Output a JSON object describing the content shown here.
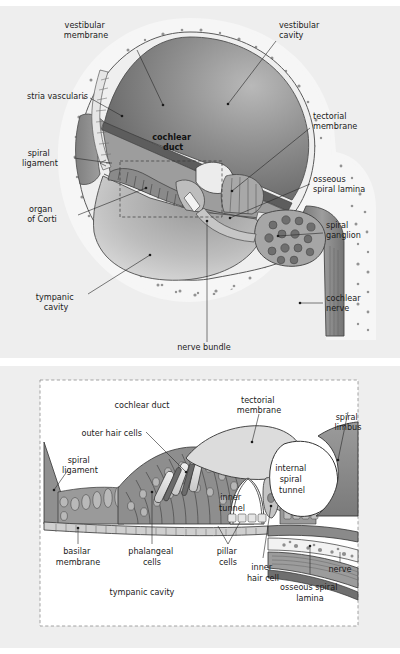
{
  "figure": {
    "background_color": "#ffffff",
    "panel_background_color": "#eeeeee",
    "ink_color": "#1b1b1b"
  },
  "palette": {
    "bone_fill": "#f4f4f4",
    "bone_stipple": "#9a9a9a",
    "vestibular_cavity_dark": "#6f6f6f",
    "vestibular_cavity_light": "#c9c9c9",
    "tympanic_cavity_dark": "#707070",
    "tympanic_cavity_light": "#d5d5d5",
    "spiral_ligament": "#8c8c8c",
    "cochlear_duct": "#a5a5a5",
    "stria_vascularis": "#e3e3e3",
    "nerve_gray": "#8f8f8f",
    "ganglion_fill": "#9e9e9e",
    "ganglion_cell": "#6e6e6e",
    "tectorial_membrane": "#d6d6d6",
    "limbus": "#8a8a8a",
    "hair_cell_light": "#e8e8e8",
    "hair_cell_mid": "#b4b4b4",
    "outline": "#2a2a2a"
  },
  "top_panel": {
    "name": "cochlear-turn-overview",
    "labels": [
      {
        "id": "vestibular-membrane",
        "text_lines": [
          "vestibular",
          "membrane"
        ],
        "x": 86,
        "y": 22,
        "anchor": "middle"
      },
      {
        "id": "vestibular-cavity",
        "text_lines": [
          "vestibular",
          "cavity"
        ],
        "x": 279,
        "y": 22,
        "anchor": "start"
      },
      {
        "id": "stria-vascularis",
        "text_lines": [
          "stria vascularis"
        ],
        "x": 27,
        "y": 93,
        "anchor": "start"
      },
      {
        "id": "tectorial-membrane",
        "text_lines": [
          "tectorial",
          "membrane"
        ],
        "x": 313,
        "y": 113,
        "anchor": "start"
      },
      {
        "id": "cochlear-duct",
        "text_lines": [
          "cochlear",
          "duct"
        ],
        "x": 173,
        "y": 134,
        "anchor": "middle",
        "bold": true
      },
      {
        "id": "spiral-ligament",
        "text_lines": [
          "spiral",
          "ligament"
        ],
        "x": 40,
        "y": 150,
        "anchor": "middle"
      },
      {
        "id": "osseous-spiral-lamina",
        "text_lines": [
          "osseous",
          "spiral lamina"
        ],
        "x": 313,
        "y": 176,
        "anchor": "start"
      },
      {
        "id": "organ-of-corti",
        "text_lines": [
          "organ",
          "of Corti"
        ],
        "x": 42,
        "y": 206,
        "anchor": "middle"
      },
      {
        "id": "spiral-ganglion",
        "text_lines": [
          "spiral",
          "ganglion"
        ],
        "x": 326,
        "y": 222,
        "anchor": "start"
      },
      {
        "id": "tympanic-cavity",
        "text_lines": [
          "tympanic",
          "cavity"
        ],
        "x": 56,
        "y": 294,
        "anchor": "middle"
      },
      {
        "id": "cochlear-nerve",
        "text_lines": [
          "cochlear",
          "nerve"
        ],
        "x": 326,
        "y": 295,
        "anchor": "start"
      },
      {
        "id": "nerve-bundle",
        "text_lines": [
          "nerve bundle"
        ],
        "x": 204,
        "y": 344,
        "anchor": "middle"
      }
    ]
  },
  "bottom_panel": {
    "name": "organ-of-corti-detail",
    "labels": [
      {
        "id": "cochlear-duct-detail",
        "text_lines": [
          "cochlear duct"
        ],
        "x": 142,
        "y": 404,
        "anchor": "middle"
      },
      {
        "id": "tectorial-membrane-detail",
        "text_lines": [
          "tectorial",
          "membrane"
        ],
        "x": 259,
        "y": 401,
        "anchor": "middle"
      },
      {
        "id": "spiral-limbus",
        "text_lines": [
          "spiral",
          "limbus"
        ],
        "x": 348,
        "y": 418,
        "anchor": "middle"
      },
      {
        "id": "outer-hair-cells",
        "text_lines": [
          "outer hair cells"
        ],
        "x": 142,
        "y": 434,
        "anchor": "end"
      },
      {
        "id": "spiral-ligament-detail",
        "text_lines": [
          "spiral",
          "ligament"
        ],
        "x": 80,
        "y": 461,
        "anchor": "middle"
      },
      {
        "id": "internal-spiral-tunnel",
        "text_lines": [
          "internal",
          "spiral",
          "tunnel"
        ],
        "x": 292,
        "y": 477,
        "anchor": "middle"
      },
      {
        "id": "inner-tunnel",
        "text_lines": [
          "inner",
          "tunnel"
        ],
        "x": 232,
        "y": 505,
        "anchor": "middle"
      },
      {
        "id": "basilar-membrane",
        "text_lines": [
          "basilar",
          "membrane"
        ],
        "x": 78,
        "y": 553,
        "anchor": "middle"
      },
      {
        "id": "phalangeal-cells",
        "text_lines": [
          "phalangeal",
          "cells"
        ],
        "x": 152,
        "y": 553,
        "anchor": "middle"
      },
      {
        "id": "pillar-cells",
        "text_lines": [
          "pillar",
          "cells"
        ],
        "x": 228,
        "y": 553,
        "anchor": "middle"
      },
      {
        "id": "nerve-detail",
        "text_lines": [
          "nerve"
        ],
        "x": 340,
        "y": 570,
        "anchor": "middle"
      },
      {
        "id": "inner-hair-cell",
        "text_lines": [
          "inner",
          "hair cell"
        ],
        "x": 263,
        "y": 570,
        "anchor": "middle"
      },
      {
        "id": "osseous-spiral-lamina-detail",
        "text_lines": [
          "osseous spiral",
          "lamina"
        ],
        "x": 310,
        "y": 590,
        "anchor": "middle"
      },
      {
        "id": "tympanic-cavity-detail",
        "text_lines": [
          "tympanic cavity"
        ],
        "x": 142,
        "y": 595,
        "anchor": "middle"
      }
    ]
  }
}
